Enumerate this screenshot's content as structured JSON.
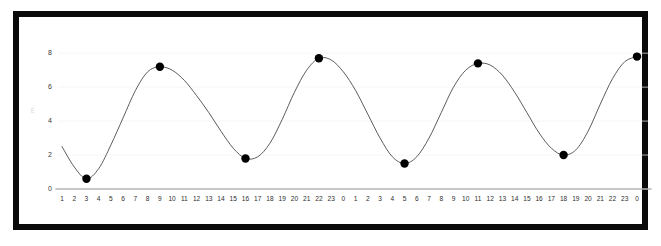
{
  "chart_data": {
    "type": "line",
    "title": "",
    "subtitle": "",
    "xlabel": "",
    "ylabel": "m",
    "legend": [],
    "legend_position": "none",
    "grid": true,
    "xlim": [
      0,
      48
    ],
    "ylim": [
      0,
      8.6
    ],
    "y_ticks": [
      0,
      2,
      4,
      6,
      8
    ],
    "y_tick_labels": [
      "0",
      "2",
      "4",
      "6",
      "8"
    ],
    "x_tick_labels": [
      "1",
      "2",
      "3",
      "4",
      "5",
      "6",
      "7",
      "8",
      "9",
      "10",
      "11",
      "12",
      "13",
      "14",
      "15",
      "16",
      "17",
      "18",
      "19",
      "20",
      "21",
      "22",
      "23",
      "0",
      "1",
      "2",
      "3",
      "4",
      "5",
      "6",
      "7",
      "8",
      "9",
      "10",
      "11",
      "12",
      "13",
      "14",
      "15",
      "16",
      "17",
      "18",
      "19",
      "20",
      "21",
      "22",
      "23",
      "0"
    ],
    "x": [
      0,
      1,
      2,
      3,
      4,
      5,
      6,
      7,
      8,
      9,
      10,
      11,
      12,
      13,
      14,
      15,
      16,
      17,
      18,
      19,
      20,
      21,
      22,
      23,
      24,
      25,
      26,
      27,
      28,
      29,
      30,
      31,
      32,
      33,
      34,
      35,
      36,
      37,
      38,
      39,
      40,
      41,
      42,
      43,
      44,
      45,
      46,
      47
    ],
    "series": [
      {
        "name": "tide height",
        "color": "#4a4a4a",
        "values": [
          2.5,
          1.3,
          0.6,
          1.2,
          2.6,
          4.2,
          5.8,
          6.9,
          7.2,
          7.0,
          6.4,
          5.5,
          4.5,
          3.4,
          2.4,
          1.8,
          1.9,
          2.7,
          4.1,
          5.7,
          7.0,
          7.7,
          7.6,
          6.9,
          5.8,
          4.4,
          3.0,
          1.9,
          1.5,
          1.9,
          3.0,
          4.5,
          6.0,
          7.0,
          7.4,
          7.3,
          6.7,
          5.7,
          4.5,
          3.3,
          2.4,
          2.0,
          2.3,
          3.4,
          5.0,
          6.5,
          7.5,
          7.8
        ]
      }
    ],
    "markers": [
      {
        "label": "min 1",
        "x_tick": "2",
        "x_index": 2,
        "y": 0.6
      },
      {
        "label": "max 1",
        "x_tick": "8",
        "x_index": 8,
        "y": 7.2
      },
      {
        "label": "min 2",
        "x_tick": "15",
        "x_index": 15,
        "y": 1.8
      },
      {
        "label": "max 2",
        "x_tick": "21",
        "x_index": 21,
        "y": 7.7
      },
      {
        "label": "min 3",
        "x_tick": "4",
        "x_index": 28,
        "y": 1.5
      },
      {
        "label": "max 3",
        "x_tick": "10",
        "x_index": 34,
        "y": 7.4
      },
      {
        "label": "min 4",
        "x_tick": "17",
        "x_index": 41,
        "y": 2.0
      },
      {
        "label": "max 4",
        "x_tick": "23",
        "x_index": 47,
        "y": 7.8
      }
    ],
    "marker_color": "#000000",
    "line_color": "#4a4a4a",
    "axis_color": "#b5b5b5",
    "grid_color": "#f2f2f2",
    "frame_color": "#0a0a0a",
    "background": "#ffffff"
  }
}
